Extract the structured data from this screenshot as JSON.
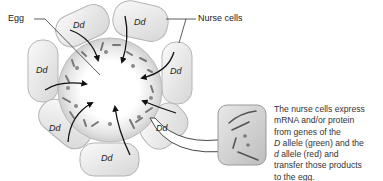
{
  "labels": {
    "egg": "Egg",
    "nurse_cells": "Nurse cells"
  },
  "nurse_cells": [
    {
      "genotype": "Dd"
    },
    {
      "genotype": "Dd"
    },
    {
      "genotype": "Dd"
    },
    {
      "genotype": "Dd"
    },
    {
      "genotype": "Dd"
    },
    {
      "genotype": "Dd"
    },
    {
      "genotype": "Dd"
    }
  ],
  "caption": {
    "line1": "The nurse cells express",
    "line2": "mRNA and/or protein",
    "line3": "from genes of the",
    "line4_italic": "D",
    "line4_rest": " allele (green) and the",
    "line5_italic": "d",
    "line5_rest": " allele (red) and",
    "line6": "transfer those products",
    "line7": "to the egg."
  }
}
